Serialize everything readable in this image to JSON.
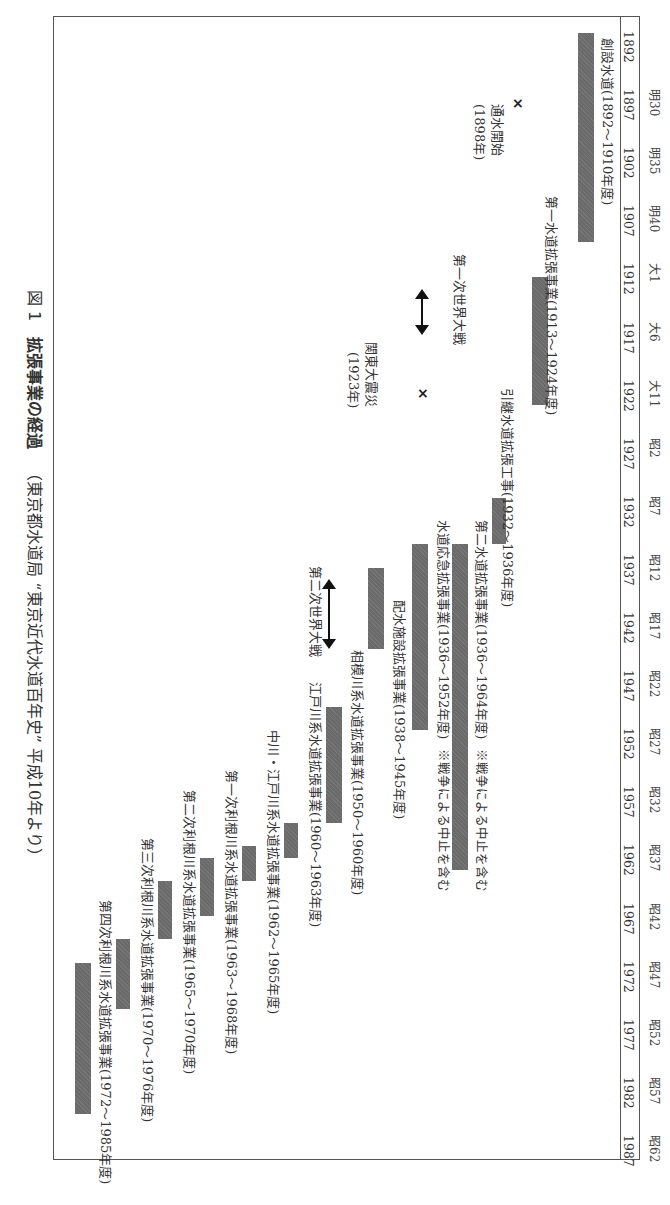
{
  "chart_data": {
    "type": "timeline",
    "orientation": "rotated-90deg (time runs top to bottom, page read rotated)",
    "title": "拡張事業の経過",
    "figure_label": "図 1",
    "source_note": "（東京都水道局 “東京近代水道百年史” 平成10年より）",
    "axis": {
      "years": [
        1892,
        1897,
        1902,
        1907,
        1912,
        1917,
        1922,
        1927,
        1932,
        1937,
        1942,
        1947,
        1952,
        1957,
        1962,
        1967,
        1972,
        1977,
        1982,
        1987
      ],
      "eras": [
        "",
        "明30",
        "明35",
        "明40",
        "大1",
        "大6",
        "大11",
        "昭2",
        "昭7",
        "昭12",
        "昭17",
        "昭22",
        "昭27",
        "昭32",
        "昭37",
        "昭42",
        "昭47",
        "昭52",
        "昭57",
        "昭62"
      ],
      "range": [
        1892,
        1987
      ]
    },
    "projects": [
      {
        "name": "創設水道",
        "label": "創設水道(1892～1910年度)",
        "start": 1892,
        "end": 1910
      },
      {
        "name": "第一水道拡張事業",
        "label": "第一水道拡張事業(1913～1924年度)",
        "start": 1913,
        "end": 1924
      },
      {
        "name": "引継水道拡張工事",
        "label": "引継水道拡張工事(1932～1936年度)",
        "start": 1932,
        "end": 1936
      },
      {
        "name": "第二水道拡張事業",
        "label": "第二水道拡張事業(1936～1964年度)",
        "note": "※戦争による中止を含む",
        "start": 1936,
        "end": 1964
      },
      {
        "name": "水道応急拡張事業",
        "label": "水道応急拡張事業(1936～1952年度)",
        "note": "※戦争による中止を含む",
        "start": 1936,
        "end": 1952
      },
      {
        "name": "配水施設拡張事業",
        "label": "配水施設拡張事業(1938～1945年度)",
        "start": 1938,
        "end": 1945
      },
      {
        "name": "相模川系水道拡張事業",
        "label": "相模川系水道拡張事業(1950～1960年度)",
        "start": 1950,
        "end": 1960
      },
      {
        "name": "江戸川系水道拡張事業",
        "label": "江戸川系水道拡張事業(1960～1963年度)",
        "start": 1960,
        "end": 1963
      },
      {
        "name": "中川・江戸川系水道拡張事業",
        "label": "中川・江戸川系水道拡張事業(1962～1965年度)",
        "start": 1962,
        "end": 1965
      },
      {
        "name": "第一次利根川系水道拡張事業",
        "label": "第一次利根川系水道拡張事業(1963～1968年度)",
        "start": 1963,
        "end": 1968
      },
      {
        "name": "第二次利根川系水道拡張事業",
        "label": "第二次利根川系水道拡張事業(1965～1970年度)",
        "start": 1965,
        "end": 1970
      },
      {
        "name": "第三次利根川系水道拡張事業",
        "label": "第三次利根川系水道拡張事業(1970～1976年度)",
        "start": 1970,
        "end": 1976
      },
      {
        "name": "第四次利根川系水道拡張事業",
        "label": "第四次利根川系水道拡張事業(1972～1985年度)",
        "start": 1972,
        "end": 1985
      }
    ],
    "events": [
      {
        "type": "point",
        "marker": "×",
        "label_line1": "通水開始",
        "label_line2": "(1898年)",
        "year": 1898
      },
      {
        "type": "range",
        "marker": "↕",
        "label": "第一次世界大戦",
        "start": 1914,
        "end": 1918
      },
      {
        "type": "point",
        "marker": "×",
        "label_line1": "関東大震災",
        "label_line2": "(1923年)",
        "year": 1923
      },
      {
        "type": "range",
        "marker": "↕",
        "label": "第二次世界大戦",
        "start": 1939,
        "end": 1945
      }
    ]
  }
}
